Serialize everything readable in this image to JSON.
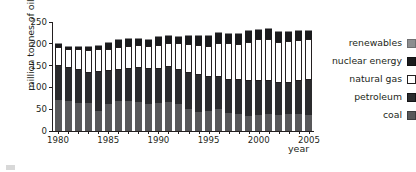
{
  "chart_data": {
    "type": "bar",
    "stacked": true,
    "title": "",
    "xlabel": "year",
    "ylabel": "million tonnes of oil equivalent",
    "ylim": [
      0,
      250
    ],
    "yticks": [
      0,
      50,
      100,
      150,
      200,
      250
    ],
    "xticks": [
      1980,
      1985,
      1990,
      1995,
      2000,
      2005
    ],
    "grid": false,
    "legend_position": "right",
    "categories": [
      1980,
      1981,
      1982,
      1983,
      1984,
      1985,
      1986,
      1987,
      1988,
      1989,
      1990,
      1991,
      1992,
      1993,
      1994,
      1995,
      1996,
      1997,
      1998,
      1999,
      2000,
      2001,
      2002,
      2003,
      2004,
      2005
    ],
    "series": [
      {
        "name": "coal",
        "color": "#58585a",
        "values": [
          70,
          69,
          65,
          65,
          46,
          63,
          68,
          68,
          67,
          63,
          65,
          66,
          61,
          51,
          44,
          46,
          50,
          41,
          38,
          35,
          36,
          38,
          36,
          39,
          38,
          36
        ]
      },
      {
        "name": "petroleum",
        "color": "#2b2b2d",
        "values": [
          80,
          75,
          74,
          69,
          90,
          74,
          73,
          74,
          77,
          80,
          78,
          80,
          78,
          81,
          84,
          77,
          73,
          77,
          78,
          80,
          79,
          77,
          74,
          72,
          76,
          80
        ]
      },
      {
        "name": "natural gas",
        "color": "#ffffff",
        "values": [
          43,
          44,
          48,
          52,
          52,
          50,
          51,
          54,
          53,
          53,
          55,
          57,
          62,
          68,
          70,
          73,
          80,
          83,
          84,
          90,
          96,
          97,
          95,
          96,
          95,
          94
        ]
      },
      {
        "name": "nuclear energy",
        "color": "#1b1b1d",
        "values": [
          9,
          7,
          8,
          9,
          9,
          17,
          17,
          16,
          15,
          15,
          18,
          16,
          17,
          19,
          22,
          23,
          24,
          22,
          24,
          24,
          22,
          22,
          22,
          21,
          20,
          19
        ]
      },
      {
        "name": "renewables",
        "color": "#8d8d8f",
        "values": [
          1,
          1,
          1,
          1,
          1,
          1,
          1,
          1,
          1,
          1,
          1,
          1,
          1,
          1,
          1,
          1,
          1,
          1,
          1,
          2,
          2,
          2,
          2,
          2,
          3,
          3
        ]
      }
    ]
  },
  "legend": {
    "items": [
      {
        "label": "renewables",
        "key": "renewables"
      },
      {
        "label": "nuclear energy",
        "key": "nuclear"
      },
      {
        "label": "natural gas",
        "key": "gas"
      },
      {
        "label": "petroleum",
        "key": "petroleum"
      },
      {
        "label": "coal",
        "key": "coal"
      }
    ]
  },
  "axes": {
    "y_title": "million tonnes of oil equivalent",
    "x_title": "year"
  }
}
